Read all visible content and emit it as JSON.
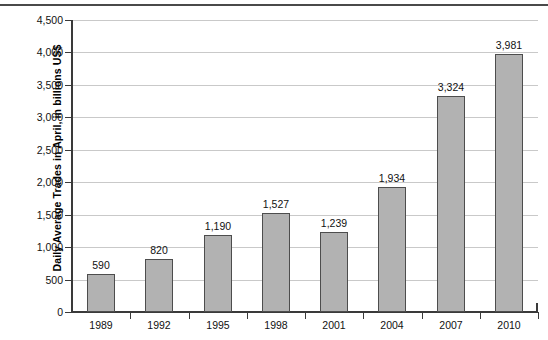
{
  "chart_data": {
    "type": "bar",
    "title": "",
    "subtitle": "",
    "xlabel": "",
    "ylabel": "Daily Average Trades in April, in billions US$",
    "categories": [
      "1989",
      "1992",
      "1995",
      "1998",
      "2001",
      "2004",
      "2007",
      "2010"
    ],
    "values": [
      590,
      820,
      1190,
      1527,
      1239,
      1934,
      3324,
      3981
    ],
    "value_labels": [
      "590",
      "820",
      "1,190",
      "1,527",
      "1,239",
      "1,934",
      "3,324",
      "3,981"
    ],
    "ylim": [
      0,
      4500
    ],
    "ytick_values": [
      0,
      500,
      1000,
      1500,
      2000,
      2500,
      3000,
      3500,
      4000,
      4500
    ],
    "ytick_labels": [
      "0",
      "500",
      "1,000",
      "1,500",
      "2,000",
      "2,500",
      "3,000",
      "3,500",
      "4,000",
      "4,500"
    ],
    "grid": true,
    "grid_axis": "y",
    "legend": false,
    "legend_position": "none",
    "bar_color": "#b2b2b2",
    "bar_border_color": "#4d4d4d",
    "gridline_color": "#c9c9c9",
    "axis_color": "#3a3a3a",
    "background_color": "#ffffff"
  }
}
